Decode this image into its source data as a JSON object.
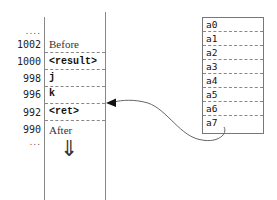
{
  "stack": {
    "top_ellipsis": "....",
    "bottom_ellipsis": "...",
    "rows": [
      {
        "address": "1002",
        "content": "Before",
        "style": "serif"
      },
      {
        "address": "1000",
        "content": "<result>",
        "style": "mono"
      },
      {
        "address": "998",
        "content": "j",
        "style": "mono"
      },
      {
        "address": "996",
        "content": "k",
        "style": "mono"
      },
      {
        "address": "992",
        "content": "<ret>",
        "style": "mono"
      },
      {
        "address": "990",
        "content": "After",
        "style": "serif"
      }
    ],
    "growth_arrow": "⇓"
  },
  "registers": {
    "labels": [
      "a0",
      "a1",
      "a2",
      "a3",
      "a4",
      "a5",
      "a6",
      "a7"
    ]
  },
  "pointer": {
    "from": "a7",
    "to": "<ret>"
  }
}
